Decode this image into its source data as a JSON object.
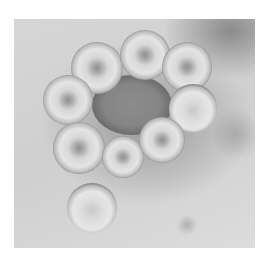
{
  "image": {
    "subject": "Negative-stain electron micrograph of a cluster of roughly spherical enveloped virus particles (influenza-like) surrounding a central irregular mass",
    "palette": {
      "background": "#d4d4d4",
      "stain_dark": "#5a5a5a",
      "particle_light": "#e4e4e4",
      "page": "#ffffff"
    },
    "particles": [
      {
        "id": "top-left",
        "cx": 97,
        "cy": 68,
        "r": 26
      },
      {
        "id": "top-center",
        "cx": 145,
        "cy": 55,
        "r": 25
      },
      {
        "id": "top-right",
        "cx": 187,
        "cy": 67,
        "r": 25
      },
      {
        "id": "left",
        "cx": 68,
        "cy": 100,
        "r": 25
      },
      {
        "id": "right",
        "cx": 193,
        "cy": 108,
        "r": 24
      },
      {
        "id": "lower-left",
        "cx": 79,
        "cy": 148,
        "r": 26
      },
      {
        "id": "lower-middle",
        "cx": 123,
        "cy": 157,
        "r": 21
      },
      {
        "id": "lower-right",
        "cx": 162,
        "cy": 140,
        "r": 23
      },
      {
        "id": "bottom",
        "cx": 92,
        "cy": 208,
        "r": 25
      }
    ],
    "central_mass": {
      "cx": 132,
      "cy": 105,
      "rx": 40,
      "ry": 30
    }
  }
}
